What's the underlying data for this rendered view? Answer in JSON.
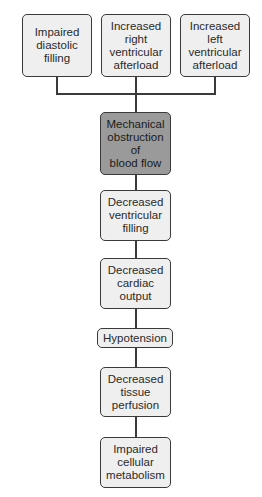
{
  "diagram": {
    "type": "flowchart",
    "causes": [
      {
        "id": "impaired-diastolic-filling",
        "label": "Impaired\ndiastolic\nfilling"
      },
      {
        "id": "increased-right-ventricular-afterload",
        "label": "Increased\nright\nventricular\nafterload"
      },
      {
        "id": "increased-left-ventricular-afterload",
        "label": "Increased\nleft\nventricular\nafterload"
      }
    ],
    "central": {
      "id": "mechanical-obstruction",
      "label": "Mechanical\nobstruction\nof\nblood flow",
      "fill": "#9a9a9a"
    },
    "chain": [
      {
        "id": "decreased-ventricular-filling",
        "label": "Decreased\nventricular\nfilling"
      },
      {
        "id": "decreased-cardiac-output",
        "label": "Decreased\ncardiac\noutput"
      },
      {
        "id": "hypotension",
        "label": "Hypotension"
      },
      {
        "id": "decreased-tissue-perfusion",
        "label": "Decreased\ntissue\nperfusion"
      },
      {
        "id": "impaired-cellular-metabolism",
        "label": "Impaired\ncellular\nmetabolism"
      }
    ],
    "colors": {
      "box_fill": "#efefef",
      "highlight_fill": "#9a9a9a",
      "stroke": "#3a3a3a"
    }
  }
}
